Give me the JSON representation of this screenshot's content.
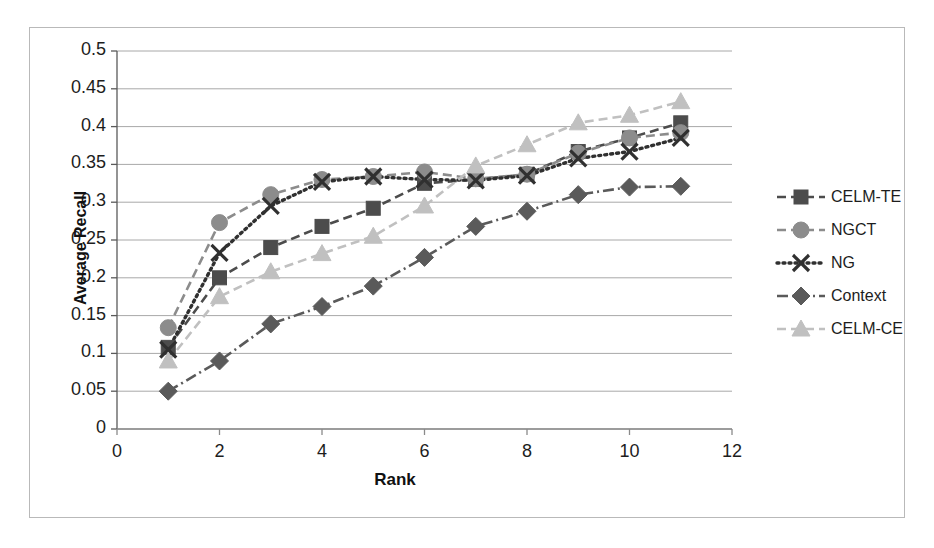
{
  "chart_data": {
    "type": "line",
    "title": "",
    "xlabel": "Rank",
    "ylabel": "Average Recall",
    "xlim": [
      0,
      12
    ],
    "ylim": [
      0,
      0.5
    ],
    "xticks": [
      "0",
      "2",
      "4",
      "6",
      "8",
      "10",
      "12"
    ],
    "xtick_values": [
      0,
      2,
      4,
      6,
      8,
      10,
      12
    ],
    "yticks": [
      "0",
      "0.05",
      "0.1",
      "0.15",
      "0.2",
      "0.25",
      "0.3",
      "0.35",
      "0.4",
      "0.45",
      "0.5"
    ],
    "ytick_values": [
      0,
      0.05,
      0.1,
      0.15,
      0.2,
      0.25,
      0.3,
      0.35,
      0.4,
      0.45,
      0.5
    ],
    "grid": "horizontal",
    "legend_position": "right",
    "x": [
      1,
      2,
      3,
      4,
      5,
      6,
      7,
      8,
      9,
      10,
      11
    ],
    "series": [
      {
        "name": "CELM-TE",
        "marker": "square",
        "dash": "dashed",
        "color": "#4c4c4c",
        "values": [
          0.108,
          0.2,
          0.24,
          0.268,
          0.292,
          0.325,
          0.33,
          0.337,
          0.367,
          0.385,
          0.405
        ]
      },
      {
        "name": "NGCT",
        "marker": "circle",
        "dash": "dashed",
        "color": "#8c8c8c",
        "values": [
          0.134,
          0.273,
          0.31,
          0.33,
          0.334,
          0.34,
          0.331,
          0.337,
          0.365,
          0.385,
          0.392
        ]
      },
      {
        "name": "NG",
        "marker": "cross",
        "dash": "dotted",
        "color": "#303030",
        "values": [
          0.105,
          0.233,
          0.295,
          0.327,
          0.334,
          0.33,
          0.329,
          0.335,
          0.358,
          0.367,
          0.385
        ]
      },
      {
        "name": "Context",
        "marker": "diamond",
        "dash": "dashdot",
        "color": "#5a5a5a",
        "values": [
          0.05,
          0.09,
          0.139,
          0.162,
          0.189,
          0.227,
          0.268,
          0.288,
          0.31,
          0.32,
          0.321
        ]
      },
      {
        "name": "CELM-CE",
        "marker": "triangle",
        "dash": "dashed",
        "color": "#c0c0c0",
        "values": [
          0.09,
          0.175,
          0.208,
          0.232,
          0.255,
          0.295,
          0.348,
          0.376,
          0.405,
          0.415,
          0.433
        ]
      }
    ]
  },
  "legend": {
    "items": [
      {
        "label": "CELM-TE"
      },
      {
        "label": "NGCT"
      },
      {
        "label": "NG"
      },
      {
        "label": "Context"
      },
      {
        "label": "CELM-CE"
      }
    ]
  }
}
